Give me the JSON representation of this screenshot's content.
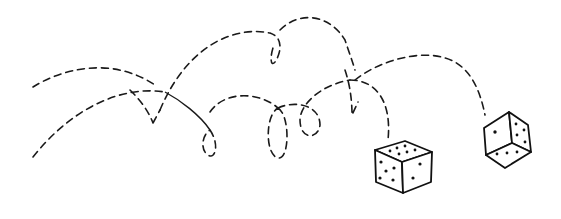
{
  "illustration": {
    "title": "Two dice rolling with bouncing trajectories",
    "colors": {
      "ink": "#1a1a1a",
      "background": "#ffffff"
    },
    "dice": [
      {
        "name": "left-die",
        "faces_visible": {
          "top": 6,
          "left": 5,
          "right": 2
        }
      },
      {
        "name": "right-die",
        "faces_visible": {
          "left": 1,
          "right": 4,
          "bottom": 3
        }
      }
    ]
  }
}
